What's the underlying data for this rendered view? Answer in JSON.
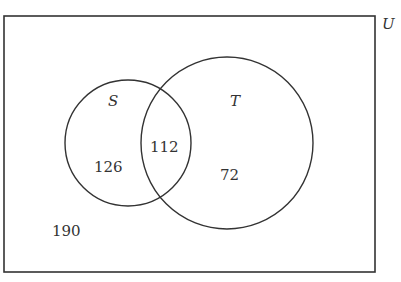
{
  "diagram": {
    "type": "venn",
    "universe_label": "U",
    "sets": [
      {
        "name": "S",
        "only_count": "126"
      },
      {
        "name": "T",
        "only_count": "72"
      }
    ],
    "intersection_count": "112",
    "outside_count": "190"
  },
  "colors": {
    "stroke": "#333333",
    "background": "#ffffff"
  }
}
